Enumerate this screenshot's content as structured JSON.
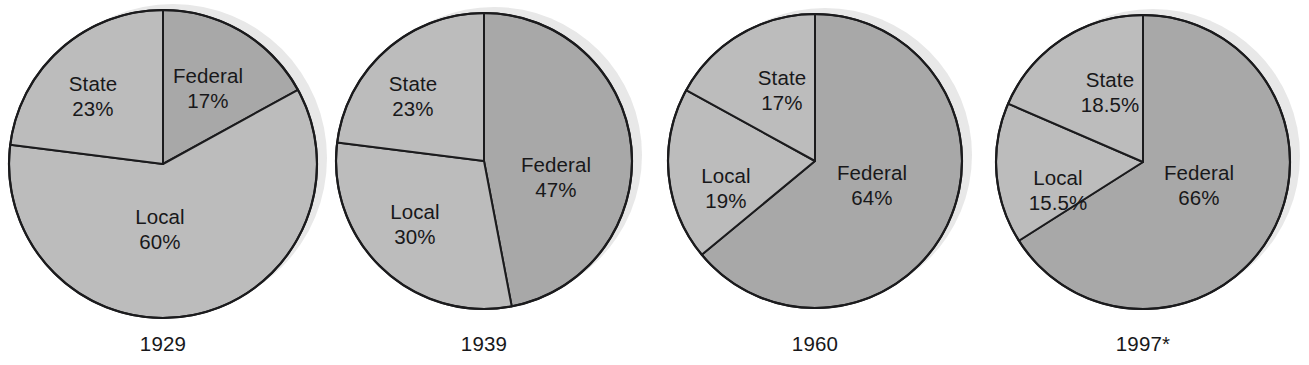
{
  "figure": {
    "type": "pie-chart-series",
    "background_color": "#ffffff",
    "text_color": "#18181a",
    "outline_color": "#1b1b1d",
    "shadow_color": "#e8e8e8",
    "segment_colors": {
      "Federal": "#a8a8a8",
      "State": "#bcbcbc",
      "Local": "#bcbcbc"
    }
  },
  "chart_data": [
    {
      "type": "pie",
      "title": "1929",
      "labels": [
        "Federal",
        "Local",
        "State"
      ],
      "values": [
        17,
        60,
        23
      ],
      "value_labels": [
        "17%",
        "60%",
        "23%"
      ],
      "start_angle_deg": 0,
      "direction": "clockwise",
      "geometry": {
        "cx": 163,
        "cy": 164,
        "r": 154
      },
      "label_positions": [
        {
          "label": "Federal",
          "x": 208,
          "y": 88
        },
        {
          "label": "Local",
          "x": 160,
          "y": 229
        },
        {
          "label": "State",
          "x": 93,
          "y": 96
        }
      ],
      "year_label_pos": {
        "x": 163,
        "y": 332
      }
    },
    {
      "type": "pie",
      "title": "1939",
      "labels": [
        "Federal",
        "Local",
        "State"
      ],
      "values": [
        47,
        30,
        23
      ],
      "value_labels": [
        "47%",
        "30%",
        "23%"
      ],
      "start_angle_deg": 0,
      "direction": "clockwise",
      "geometry": {
        "cx": 484,
        "cy": 161,
        "r": 148
      },
      "label_positions": [
        {
          "label": "Federal",
          "x": 556,
          "y": 177
        },
        {
          "label": "Local",
          "x": 415,
          "y": 224
        },
        {
          "label": "State",
          "x": 413,
          "y": 96
        }
      ],
      "year_label_pos": {
        "x": 484,
        "y": 332
      }
    },
    {
      "type": "pie",
      "title": "1960",
      "labels": [
        "Federal",
        "Local",
        "State"
      ],
      "values": [
        64,
        19,
        17
      ],
      "value_labels": [
        "64%",
        "19%",
        "17%"
      ],
      "start_angle_deg": 0,
      "direction": "clockwise",
      "geometry": {
        "cx": 815,
        "cy": 161,
        "r": 147
      },
      "label_positions": [
        {
          "label": "Federal",
          "x": 872,
          "y": 185
        },
        {
          "label": "Local",
          "x": 726,
          "y": 188
        },
        {
          "label": "State",
          "x": 782,
          "y": 90
        }
      ],
      "year_label_pos": {
        "x": 815,
        "y": 332
      }
    },
    {
      "type": "pie",
      "title": "1997*",
      "labels": [
        "Federal",
        "Local",
        "State"
      ],
      "values": [
        66,
        15.5,
        18.5
      ],
      "value_labels": [
        "66%",
        "15.5%",
        "18.5%"
      ],
      "start_angle_deg": 0,
      "direction": "clockwise",
      "geometry": {
        "cx": 1143,
        "cy": 162,
        "r": 147
      },
      "label_positions": [
        {
          "label": "Federal",
          "x": 1199,
          "y": 185
        },
        {
          "label": "Local",
          "x": 1058,
          "y": 190
        },
        {
          "label": "State",
          "x": 1110,
          "y": 92
        }
      ],
      "year_label_pos": {
        "x": 1143,
        "y": 332
      }
    }
  ]
}
